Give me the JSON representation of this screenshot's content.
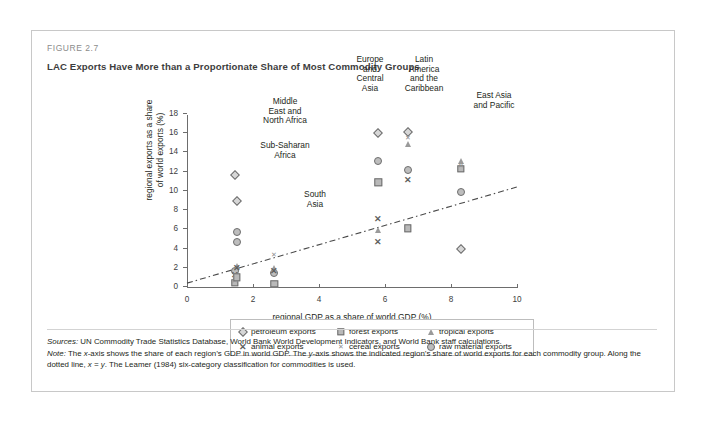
{
  "figure": {
    "number": "FIGURE 2.7",
    "title": "LAC Exports Have More than a Proportionate Share of Most Commodity Groups"
  },
  "notes": {
    "sources_label": "Sources:",
    "sources_text": " UN Commodity Trade Statistics Database, World Bank World Development Indicators, and World Bank staff calculations.",
    "note_label": "Note:",
    "note_text_1": " The ",
    "note_italic_x": "x",
    "note_text_2": "-axis shows the share of each region’s GDP in world GDP. The ",
    "note_italic_y": "y",
    "note_text_3": "-axis shows the indicated region’s share of world exports for each commodity group. Along the dotted line, ",
    "note_italic_eq": "x = y",
    "note_text_4": ". The Leamer (1984) six-category classification for commodities is used."
  },
  "chart_data": {
    "type": "scatter",
    "title": "LAC Exports Have More than a Proportionate Share of Most Commodity Groups",
    "xlabel": "regional GDP as a share of world GDP (%)",
    "ylabel": "regional exports as a share\nof world exports (%)",
    "xlim": [
      0,
      10
    ],
    "ylim": [
      0,
      18
    ],
    "xticks": [
      0,
      2,
      4,
      6,
      8,
      10
    ],
    "yticks": [
      0,
      2,
      4,
      6,
      8,
      10,
      12,
      14,
      16,
      18
    ],
    "grid": false,
    "legend_position": "below-axes",
    "reference_line": {
      "label": "x = y",
      "style": "dash-dot",
      "from": [
        0,
        0.3
      ],
      "to": [
        10,
        10.3
      ]
    },
    "series": [
      {
        "name": "petroleum exports",
        "marker": "diamond"
      },
      {
        "name": "forest exports",
        "marker": "square"
      },
      {
        "name": "tropical exports",
        "marker": "triangle"
      },
      {
        "name": "animal exports",
        "marker": "x-large"
      },
      {
        "name": "cereal exports",
        "marker": "x-small"
      },
      {
        "name": "raw material exports",
        "marker": "circle"
      }
    ],
    "regions": [
      {
        "name": "Middle East and North Africa",
        "label_lines": "Middle\nEast and\nNorth Africa",
        "x": 1.45,
        "points": [
          {
            "series": "petroleum exports",
            "marker": "diamond",
            "x": 1.45,
            "y": 11.5
          },
          {
            "series": "raw material exports",
            "marker": "circle",
            "x": 1.45,
            "y": 1.6
          },
          {
            "series": "animal exports",
            "marker": "x-large",
            "x": 1.45,
            "y": 1.1
          },
          {
            "series": "forest exports",
            "marker": "square",
            "x": 1.45,
            "y": 0.35
          },
          {
            "series": "tropical exports",
            "marker": "triangle",
            "x": 1.45,
            "y": 0.8
          },
          {
            "series": "cereal exports",
            "marker": "x-small",
            "x": 1.45,
            "y": 0.55
          }
        ]
      },
      {
        "name": "Sub-Saharan Africa",
        "label_lines": "Sub-Saharan\nAfrica",
        "x": 1.5,
        "points": [
          {
            "series": "petroleum exports",
            "marker": "diamond",
            "x": 1.5,
            "y": 8.8
          },
          {
            "series": "raw material exports",
            "marker": "circle",
            "x": 1.5,
            "y": 5.6
          },
          {
            "series": "raw material exports",
            "marker": "circle",
            "x": 1.5,
            "y": 4.6
          },
          {
            "series": "tropical exports",
            "marker": "triangle",
            "x": 1.5,
            "y": 2.1
          },
          {
            "series": "animal exports",
            "marker": "x-large",
            "x": 1.5,
            "y": 1.9
          },
          {
            "series": "forest exports",
            "marker": "square",
            "x": 1.5,
            "y": 0.9
          }
        ]
      },
      {
        "name": "South Asia",
        "label_lines": "South\nAsia",
        "x": 2.65,
        "points": [
          {
            "series": "cereal exports",
            "marker": "x-small",
            "x": 2.65,
            "y": 3.2
          },
          {
            "series": "raw material exports",
            "marker": "circle",
            "x": 2.65,
            "y": 1.4
          },
          {
            "series": "tropical exports",
            "marker": "triangle",
            "x": 2.65,
            "y": 1.9
          },
          {
            "series": "animal exports",
            "marker": "x-large",
            "x": 2.65,
            "y": 1.6
          },
          {
            "series": "forest exports",
            "marker": "square",
            "x": 2.65,
            "y": 0.2
          }
        ]
      },
      {
        "name": "Europe and Central Asia",
        "label_lines": "Europe\nand\nCentral\nAsia",
        "x": 5.8,
        "points": [
          {
            "series": "petroleum exports",
            "marker": "diamond",
            "x": 5.8,
            "y": 15.9
          },
          {
            "series": "raw material exports",
            "marker": "circle",
            "x": 5.8,
            "y": 13.0
          },
          {
            "series": "forest exports",
            "marker": "square",
            "x": 5.8,
            "y": 10.8
          },
          {
            "series": "animal exports",
            "marker": "x-large",
            "x": 5.8,
            "y": 7.0
          },
          {
            "series": "tropical exports",
            "marker": "triangle",
            "x": 5.8,
            "y": 5.8
          },
          {
            "series": "animal exports",
            "marker": "x-large",
            "x": 5.8,
            "y": 4.6
          }
        ]
      },
      {
        "name": "Latin America and the Caribbean",
        "label_lines": "Latin\nAmerica\nand the\nCaribbean",
        "x": 6.7,
        "points": [
          {
            "series": "petroleum exports",
            "marker": "diamond",
            "x": 6.7,
            "y": 16.0
          },
          {
            "series": "cereal exports",
            "marker": "x-small",
            "x": 6.7,
            "y": 15.4
          },
          {
            "series": "tropical exports",
            "marker": "triangle",
            "x": 6.7,
            "y": 14.8
          },
          {
            "series": "raw material exports",
            "marker": "circle",
            "x": 6.7,
            "y": 12.1
          },
          {
            "series": "animal exports",
            "marker": "x-large",
            "x": 6.7,
            "y": 11.0
          },
          {
            "series": "forest exports",
            "marker": "square",
            "x": 6.7,
            "y": 6.0
          }
        ]
      },
      {
        "name": "East Asia and Pacific",
        "label_lines": "East Asia\nand Pacific",
        "x": 8.3,
        "points": [
          {
            "series": "tropical exports",
            "marker": "triangle",
            "x": 8.3,
            "y": 13.0
          },
          {
            "series": "forest exports",
            "marker": "square",
            "x": 8.3,
            "y": 12.2
          },
          {
            "series": "cereal exports",
            "marker": "x-small",
            "x": 8.3,
            "y": 12.5
          },
          {
            "series": "raw material exports",
            "marker": "circle",
            "x": 8.3,
            "y": 9.8
          },
          {
            "series": "petroleum exports",
            "marker": "diamond",
            "x": 8.3,
            "y": 3.8
          }
        ]
      }
    ]
  }
}
